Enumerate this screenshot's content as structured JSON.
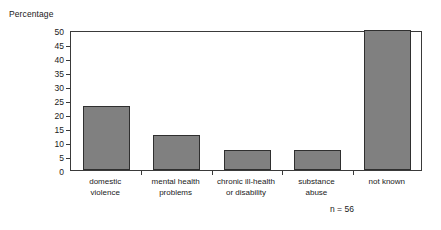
{
  "chart_data": {
    "type": "bar",
    "title": "",
    "ylabel": "Percentage",
    "xlabel": "",
    "categories": [
      "domestic\nviolence",
      "mental health\nproblems",
      "chronic ill-health\nor disability",
      "substance\nabuse",
      "not known"
    ],
    "values": [
      23,
      12.5,
      7,
      7,
      50
    ],
    "ylim": [
      0,
      50
    ],
    "ytick_step": 5,
    "yticks": [
      0,
      5,
      10,
      15,
      20,
      25,
      30,
      35,
      40,
      45,
      50
    ],
    "ytick_labels": [
      "0",
      "5",
      "10",
      "15",
      "20",
      "25",
      "30",
      "35",
      "40",
      "45",
      "50"
    ],
    "grid": false,
    "legend": null,
    "annotations": [
      "n = 56"
    ],
    "bar_color": "#808080",
    "bar_edge_color": "#2f2f2f",
    "axis_color": "#3a3a3a"
  },
  "annotation": {
    "sample_size": "n = 56"
  }
}
